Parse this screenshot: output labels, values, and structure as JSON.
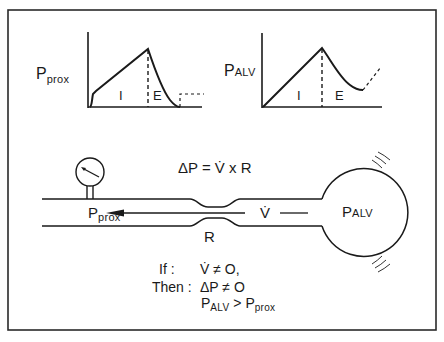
{
  "figure": {
    "border_color": "#2a2a2a",
    "stroke_color": "#1a1a1a"
  },
  "graph_left": {
    "y_label_main": "P",
    "y_label_sub": "prox",
    "phase_inspiration": "I",
    "phase_expiration": "E"
  },
  "graph_right": {
    "y_label_main": "P",
    "y_label_sub": "ALV",
    "phase_inspiration": "I",
    "phase_expiration": "E"
  },
  "equation": "ΔP = V̇ x R",
  "airway": {
    "gauge_label_main": "P",
    "gauge_label_sub": "prox",
    "flow_label": "V̇",
    "resistance_label": "R",
    "alveolus_label_main": "P",
    "alveolus_label_sub": "ALV"
  },
  "conclusion": {
    "if_label": "If :",
    "if_text": "V̇ ≠ O,",
    "then_label": "Then :",
    "then_text": "ΔP ≠ O",
    "result_a_main": "P",
    "result_a_sub": "ALV",
    "result_op": ">",
    "result_b_main": "P",
    "result_b_sub": "prox"
  }
}
